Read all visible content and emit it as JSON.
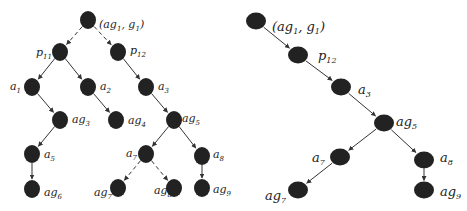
{
  "colors": {
    "node": "#222222",
    "edge": "#333333",
    "background": "#ffffff"
  },
  "left_tree": {
    "nodes": [
      {
        "id": "root",
        "x": 88,
        "y": 20,
        "label_base": "(ag",
        "label_sub": "1",
        "label_mid": ", g",
        "label_sub2": "1",
        "label_end": ")",
        "lx": 99,
        "ly": 24
      },
      {
        "id": "p11",
        "x": 60,
        "y": 52,
        "label_base": "p",
        "label_sub": "11",
        "lx": 36,
        "ly": 52
      },
      {
        "id": "p12",
        "x": 118,
        "y": 52,
        "label_base": "p",
        "label_sub": "12",
        "lx": 130,
        "ly": 50
      },
      {
        "id": "a1",
        "x": 32,
        "y": 87,
        "label_base": "a",
        "label_sub": "1",
        "lx": 10,
        "ly": 86
      },
      {
        "id": "a2",
        "x": 88,
        "y": 87,
        "label_base": "a",
        "label_sub": "2",
        "lx": 100,
        "ly": 86
      },
      {
        "id": "a3",
        "x": 146,
        "y": 87,
        "label_base": "a",
        "label_sub": "3",
        "lx": 158,
        "ly": 86
      },
      {
        "id": "ag3",
        "x": 60,
        "y": 120,
        "label_base": "ag",
        "label_sub": "3",
        "lx": 72,
        "ly": 119
      },
      {
        "id": "ag4",
        "x": 116,
        "y": 120,
        "label_base": "ag",
        "label_sub": "4",
        "lx": 128,
        "ly": 120
      },
      {
        "id": "ag5",
        "x": 174,
        "y": 120,
        "label_base": "ag",
        "label_sub": "5",
        "lx": 182,
        "ly": 118
      },
      {
        "id": "a5",
        "x": 32,
        "y": 154,
        "label_base": "a",
        "label_sub": "5",
        "lx": 44,
        "ly": 154
      },
      {
        "id": "a7",
        "x": 146,
        "y": 154,
        "label_base": "a",
        "label_sub": "7",
        "lx": 126,
        "ly": 153
      },
      {
        "id": "a8",
        "x": 202,
        "y": 156,
        "label_base": "a",
        "label_sub": "8",
        "lx": 213,
        "ly": 154
      },
      {
        "id": "ag6",
        "x": 32,
        "y": 189,
        "label_base": "ag",
        "label_sub": "6",
        "lx": 44,
        "ly": 192
      },
      {
        "id": "ag7",
        "x": 118,
        "y": 188,
        "label_base": "ag",
        "label_sub": "7",
        "lx": 94,
        "ly": 192
      },
      {
        "id": "ag8",
        "x": 174,
        "y": 188,
        "label_base": "ag",
        "label_sub": "8",
        "lx": 154,
        "ly": 190
      },
      {
        "id": "ag9",
        "x": 202,
        "y": 188,
        "label_base": "ag",
        "label_sub": "9",
        "lx": 213,
        "ly": 189
      }
    ],
    "edges": [
      {
        "from": "root",
        "to": "p11",
        "dashed": true
      },
      {
        "from": "root",
        "to": "p12",
        "dashed": true
      },
      {
        "from": "p11",
        "to": "a1",
        "dashed": false
      },
      {
        "from": "p11",
        "to": "a2",
        "dashed": false
      },
      {
        "from": "p12",
        "to": "a3",
        "dashed": false
      },
      {
        "from": "a1",
        "to": "ag3",
        "dashed": false
      },
      {
        "from": "a2",
        "to": "ag4",
        "dashed": false
      },
      {
        "from": "a3",
        "to": "ag5",
        "dashed": false
      },
      {
        "from": "ag3",
        "to": "a5",
        "dashed": false
      },
      {
        "from": "ag5",
        "to": "a7",
        "dashed": false
      },
      {
        "from": "ag5",
        "to": "a8",
        "dashed": false
      },
      {
        "from": "a5",
        "to": "ag6",
        "dashed": false
      },
      {
        "from": "a7",
        "to": "ag7",
        "dashed": true
      },
      {
        "from": "a7",
        "to": "ag8",
        "dashed": true
      },
      {
        "from": "a8",
        "to": "ag9",
        "dashed": false
      }
    ]
  },
  "right_tree": {
    "nodes": [
      {
        "id": "root",
        "x": 256,
        "y": 21,
        "label_base": "(ag",
        "label_sub": "1",
        "label_mid": ", g",
        "label_sub2": "1",
        "label_end": ")",
        "lx": 272,
        "ly": 27
      },
      {
        "id": "p12",
        "x": 298,
        "y": 55,
        "label_base": "p",
        "label_sub": "12",
        "lx": 318,
        "ly": 56
      },
      {
        "id": "a3",
        "x": 341,
        "y": 87,
        "label_base": "a",
        "label_sub": "3",
        "lx": 358,
        "ly": 90
      },
      {
        "id": "ag5",
        "x": 384,
        "y": 123,
        "label_base": "ag",
        "label_sub": "5",
        "lx": 396,
        "ly": 122
      },
      {
        "id": "a7",
        "x": 340,
        "y": 157,
        "label_base": "a",
        "label_sub": "7",
        "lx": 312,
        "ly": 158
      },
      {
        "id": "a8",
        "x": 424,
        "y": 160,
        "label_base": "a",
        "label_sub": "8",
        "lx": 440,
        "ly": 158
      },
      {
        "id": "ag7",
        "x": 298,
        "y": 190,
        "label_base": "ag",
        "label_sub": "7",
        "lx": 265,
        "ly": 196
      },
      {
        "id": "ag9",
        "x": 424,
        "y": 190,
        "label_base": "ag",
        "label_sub": "9",
        "lx": 440,
        "ly": 192
      }
    ],
    "edges": [
      {
        "from": "root",
        "to": "p12",
        "dashed": false
      },
      {
        "from": "p12",
        "to": "a3",
        "dashed": false
      },
      {
        "from": "a3",
        "to": "ag5",
        "dashed": false
      },
      {
        "from": "ag5",
        "to": "a7",
        "dashed": false
      },
      {
        "from": "ag5",
        "to": "a8",
        "dashed": false
      },
      {
        "from": "a7",
        "to": "ag7",
        "dashed": false
      },
      {
        "from": "a8",
        "to": "ag9",
        "dashed": false
      }
    ]
  }
}
